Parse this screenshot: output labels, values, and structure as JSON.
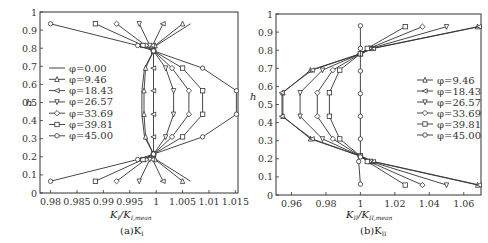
{
  "chart_data": [
    {
      "type": "line",
      "title": "",
      "caption": "(a)K_I",
      "xlabel": "K_I / K_I,mean",
      "ylabel": "h",
      "xlim": [
        0.978,
        1.0155
      ],
      "ylim": [
        0,
        1
      ],
      "xticks": [
        0.98,
        0.985,
        0.99,
        0.995,
        1,
        1.005,
        1.01,
        1.015
      ],
      "xtick_labels": [
        "0.98",
        "0.985",
        "0.99",
        "0.995",
        "1",
        "1.005",
        "1.01",
        "1.015"
      ],
      "yticks": [
        0,
        0.1,
        0.2,
        0.3,
        0.4,
        0.5,
        0.6,
        0.7,
        0.8,
        0.9,
        1
      ],
      "ytick_labels": [
        "0",
        "0.1",
        "0.2",
        "0.3",
        "0.4",
        "0.5",
        "0.6",
        "0.7",
        "0.8",
        "0.9",
        "1"
      ],
      "grid": false,
      "legend_position": "center-left",
      "series": [
        {
          "name": "φ=0.00",
          "marker": "none",
          "points": [
            [
              1.0065,
              0.935
            ],
            [
              1.0,
              0.815
            ],
            [
              0.9995,
              0.785
            ],
            [
              0.9978,
              0.69
            ],
            [
              0.9973,
              0.565
            ],
            [
              0.9973,
              0.435
            ],
            [
              0.9978,
              0.31
            ],
            [
              0.9995,
              0.215
            ],
            [
              1.0,
              0.185
            ],
            [
              1.0065,
              0.065
            ]
          ]
        },
        {
          "name": "φ=9.46",
          "marker": "triangle-up",
          "points": [
            [
              1.005,
              0.935
            ],
            [
              0.9998,
              0.815
            ],
            [
              0.9995,
              0.785
            ],
            [
              0.998,
              0.69
            ],
            [
              0.9977,
              0.565
            ],
            [
              0.9977,
              0.435
            ],
            [
              0.998,
              0.31
            ],
            [
              0.9995,
              0.215
            ],
            [
              0.9998,
              0.185
            ],
            [
              1.005,
              0.065
            ]
          ]
        },
        {
          "name": "φ=18.43",
          "marker": "triangle-left",
          "points": [
            [
              1.0013,
              0.935
            ],
            [
              0.9993,
              0.815
            ],
            [
              0.9995,
              0.785
            ],
            [
              0.9995,
              0.69
            ],
            [
              0.9995,
              0.565
            ],
            [
              0.9995,
              0.435
            ],
            [
              0.9995,
              0.31
            ],
            [
              0.9995,
              0.215
            ],
            [
              0.9993,
              0.185
            ],
            [
              1.0013,
              0.065
            ]
          ]
        },
        {
          "name": "φ=26.57",
          "marker": "triangle-down",
          "points": [
            [
              0.9968,
              0.935
            ],
            [
              0.9988,
              0.815
            ],
            [
              0.9995,
              0.785
            ],
            [
              1.0018,
              0.69
            ],
            [
              1.0033,
              0.565
            ],
            [
              1.0033,
              0.435
            ],
            [
              1.0018,
              0.31
            ],
            [
              0.9995,
              0.215
            ],
            [
              0.9988,
              0.185
            ],
            [
              0.9968,
              0.065
            ]
          ]
        },
        {
          "name": "φ=33.69",
          "marker": "diamond",
          "points": [
            [
              0.9925,
              0.935
            ],
            [
              0.998,
              0.815
            ],
            [
              0.9995,
              0.785
            ],
            [
              1.003,
              0.69
            ],
            [
              1.0062,
              0.565
            ],
            [
              1.0062,
              0.435
            ],
            [
              1.003,
              0.31
            ],
            [
              0.9995,
              0.215
            ],
            [
              0.998,
              0.185
            ],
            [
              0.9925,
              0.065
            ]
          ]
        },
        {
          "name": "φ=39.81",
          "marker": "square",
          "points": [
            [
              0.9885,
              0.935
            ],
            [
              0.9975,
              0.815
            ],
            [
              0.9995,
              0.785
            ],
            [
              1.005,
              0.69
            ],
            [
              1.0088,
              0.565
            ],
            [
              1.0088,
              0.435
            ],
            [
              1.005,
              0.31
            ],
            [
              0.9995,
              0.215
            ],
            [
              0.9975,
              0.185
            ],
            [
              0.9885,
              0.065
            ]
          ]
        },
        {
          "name": "φ=45.00",
          "marker": "circle",
          "points": [
            [
              0.98,
              0.935
            ],
            [
              0.9965,
              0.815
            ],
            [
              0.9995,
              0.785
            ],
            [
              1.0088,
              0.69
            ],
            [
              1.0152,
              0.565
            ],
            [
              1.0152,
              0.435
            ],
            [
              1.0088,
              0.31
            ],
            [
              0.9995,
              0.215
            ],
            [
              0.9965,
              0.185
            ],
            [
              0.98,
              0.065
            ]
          ]
        }
      ]
    },
    {
      "type": "line",
      "title": "",
      "caption": "(b)K_II",
      "xlabel": "K_II / K_II,mean",
      "ylabel": "h",
      "xlim": [
        0.951,
        1.07
      ],
      "ylim": [
        0,
        1
      ],
      "xticks": [
        0.96,
        0.98,
        1,
        1.02,
        1.04,
        1.06
      ],
      "xtick_labels": [
        "0.96",
        "0.98",
        "1",
        "1.02",
        "1.04",
        "1.06"
      ],
      "yticks": [
        0,
        0.1,
        0.2,
        0.3,
        0.4,
        0.5,
        0.6,
        0.7,
        0.8,
        0.9,
        1
      ],
      "ytick_labels": [
        "0",
        "0.1",
        "0.2",
        "0.3",
        "0.4",
        "0.5",
        "0.6",
        "0.7",
        "0.8",
        "0.9",
        "1"
      ],
      "grid": false,
      "legend_position": "center-right",
      "series": [
        {
          "name": "φ=9.46",
          "marker": "triangle-up",
          "points": [
            [
              1.068,
              0.93
            ],
            [
              1.007,
              0.81
            ],
            [
              1.0,
              0.78
            ],
            [
              0.971,
              0.69
            ],
            [
              0.955,
              0.565
            ],
            [
              0.955,
              0.435
            ],
            [
              0.971,
              0.31
            ],
            [
              1.0,
              0.215
            ],
            [
              1.007,
              0.185
            ],
            [
              1.068,
              0.055
            ]
          ]
        },
        {
          "name": "φ=18.43",
          "marker": "triangle-left",
          "points": [
            [
              1.069,
              0.93
            ],
            [
              1.0075,
              0.81
            ],
            [
              1.0,
              0.78
            ],
            [
              0.972,
              0.69
            ],
            [
              0.9545,
              0.565
            ],
            [
              0.9545,
              0.435
            ],
            [
              0.972,
              0.31
            ],
            [
              1.0,
              0.215
            ],
            [
              1.0075,
              0.185
            ],
            [
              1.069,
              0.055
            ]
          ]
        },
        {
          "name": "φ=26.57",
          "marker": "triangle-down",
          "points": [
            [
              1.05,
              0.93
            ],
            [
              1.006,
              0.81
            ],
            [
              1.0,
              0.78
            ],
            [
              0.978,
              0.69
            ],
            [
              0.965,
              0.565
            ],
            [
              0.965,
              0.435
            ],
            [
              0.978,
              0.31
            ],
            [
              1.0,
              0.215
            ],
            [
              1.006,
              0.185
            ],
            [
              1.05,
              0.055
            ]
          ]
        },
        {
          "name": "φ=33.69",
          "marker": "diamond",
          "points": [
            [
              1.036,
              0.93
            ],
            [
              1.005,
              0.81
            ],
            [
              1.0,
              0.78
            ],
            [
              0.984,
              0.69
            ],
            [
              0.975,
              0.565
            ],
            [
              0.975,
              0.435
            ],
            [
              0.984,
              0.31
            ],
            [
              1.0,
              0.215
            ],
            [
              1.005,
              0.185
            ],
            [
              1.036,
              0.055
            ]
          ]
        },
        {
          "name": "φ=39.81",
          "marker": "square",
          "points": [
            [
              1.026,
              0.93
            ],
            [
              1.004,
              0.81
            ],
            [
              1.0,
              0.78
            ],
            [
              0.988,
              0.69
            ],
            [
              0.982,
              0.565
            ],
            [
              0.982,
              0.435
            ],
            [
              0.988,
              0.31
            ],
            [
              1.0,
              0.215
            ],
            [
              1.004,
              0.185
            ],
            [
              1.026,
              0.055
            ]
          ]
        },
        {
          "name": "φ=45.00",
          "marker": "circle",
          "points": [
            [
              1.0,
              0.935
            ],
            [
              1.0,
              0.81
            ],
            [
              1.0,
              0.685
            ],
            [
              1.0,
              0.56
            ],
            [
              1.0,
              0.435
            ],
            [
              1.0,
              0.31
            ],
            [
              1.0,
              0.21
            ],
            [
              0.999,
              0.185
            ],
            [
              1.0,
              0.06
            ]
          ]
        }
      ]
    }
  ],
  "panels": {
    "a": {
      "ylabel": "h",
      "xlabel_main": "K",
      "xlabel_sub1": "I",
      "xlabel_sep": "/K",
      "xlabel_sub2": "I,mean",
      "caption_prefix": "(a)K",
      "caption_sub": "I",
      "legend": [
        "φ=0.00",
        "φ=9.46",
        "φ=18.43",
        "φ=26.57",
        "φ=33.69",
        "φ=39.81",
        "φ=45.00"
      ]
    },
    "b": {
      "ylabel": "h",
      "xlabel_main": "K",
      "xlabel_sub1": "II",
      "xlabel_sep": "/K",
      "xlabel_sub2": "II,mean",
      "caption_prefix": "(b)K",
      "caption_sub": "II",
      "legend": [
        "φ=9.46",
        "φ=18.43",
        "φ=26.57",
        "φ=33.69",
        "φ=39.81",
        "φ=45.00"
      ]
    }
  },
  "colors": {
    "line": "#333333",
    "axis": "#333333",
    "background": "#ffffff"
  }
}
